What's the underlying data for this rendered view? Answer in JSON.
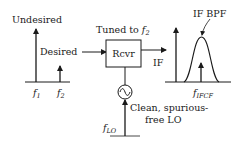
{
  "diagram": {
    "left_spectrum": {
      "undesired_label": "Undesired",
      "desired_label": "Desired",
      "f1_label": "f",
      "f1_sub": "1",
      "f2_label": "f",
      "f2_sub": "2"
    },
    "receiver": {
      "tuned_label": "Tuned to ",
      "tuned_f": "f",
      "tuned_sub": "2",
      "box_label": "Rcvr",
      "output_label": "IF"
    },
    "local_oscillator": {
      "symbol": "sine-source",
      "freq_label": "f",
      "freq_sub": "LO",
      "note_line1": "Clean, spurious-",
      "note_line2": "free LO"
    },
    "right_spectrum": {
      "filter_label": "IF BPF",
      "center_label": "f",
      "center_sub": "IFCF"
    },
    "colors": {
      "stroke": "#1a1a1a",
      "background": "#ffffff"
    }
  }
}
